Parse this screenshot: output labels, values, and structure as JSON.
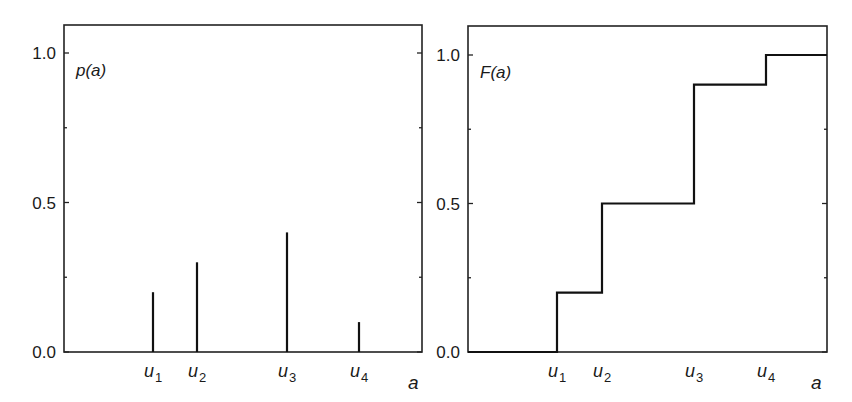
{
  "chart_data": [
    {
      "type": "bar",
      "subtype": "stem",
      "title": "",
      "function_label": "p(a)",
      "xlabel": "a",
      "ylabel": "",
      "categories": [
        "u1",
        "u2",
        "u3",
        "u4"
      ],
      "category_labels": [
        {
          "base": "u",
          "sub": "1"
        },
        {
          "base": "u",
          "sub": "2"
        },
        {
          "base": "u",
          "sub": "3"
        },
        {
          "base": "u",
          "sub": "4"
        }
      ],
      "values": [
        0.2,
        0.3,
        0.4,
        0.1
      ],
      "ylim": [
        0.0,
        1.1
      ],
      "yticks": [
        "0.0",
        "0.5",
        "1.0"
      ],
      "ytick_values": [
        0.0,
        0.5,
        1.0
      ],
      "minor_yticks": [
        0.25,
        0.75
      ],
      "grid": false,
      "legend": "none"
    },
    {
      "type": "line",
      "subtype": "step",
      "title": "",
      "function_label": "F(a)",
      "xlabel": "a",
      "ylabel": "",
      "categories": [
        "u1",
        "u2",
        "u3",
        "u4"
      ],
      "category_labels": [
        {
          "base": "u",
          "sub": "1"
        },
        {
          "base": "u",
          "sub": "2"
        },
        {
          "base": "u",
          "sub": "3"
        },
        {
          "base": "u",
          "sub": "4"
        }
      ],
      "values": [
        0.2,
        0.5,
        0.9,
        1.0
      ],
      "initial_value": 0.0,
      "ylim": [
        0.0,
        1.1
      ],
      "yticks": [
        "0.0",
        "0.5",
        "1.0"
      ],
      "ytick_values": [
        0.0,
        0.5,
        1.0
      ],
      "minor_yticks": [
        0.25,
        0.75
      ],
      "grid": false,
      "legend": "none"
    }
  ],
  "layout": {
    "panels": [
      {
        "x0": 64,
        "x1": 422,
        "y_top": 25,
        "y0px": 352,
        "y1px": 53,
        "cat_x": [
          153,
          197,
          287,
          359
        ],
        "var_x": 408
      },
      {
        "x0": 468,
        "x1": 827,
        "y_top": 26,
        "y0px": 352,
        "y1px": 55,
        "cat_x": [
          557,
          602,
          694,
          766
        ],
        "var_x": 811
      }
    ],
    "colors": {
      "line": "#111111",
      "frame": "#222222",
      "background": "#ffffff"
    }
  }
}
